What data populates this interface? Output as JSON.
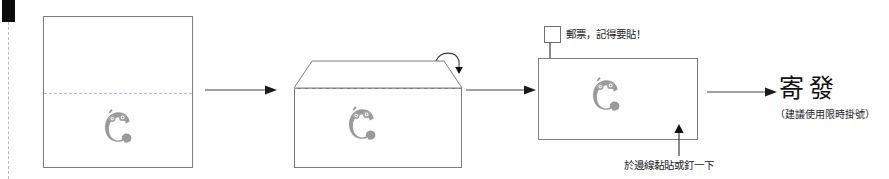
{
  "diagram": {
    "title_text": "寄發",
    "subtitle_text": "（建議使用限時掛號）",
    "stamp_note": "郵票，記得要貼！",
    "edge_note": "於邊線黏貼或釘一下",
    "colors": {
      "outline": "#7d7d7d",
      "fold_line": "#c0bcd8",
      "logo": "#9a9a9a",
      "arrow": "#444444",
      "text": "#1c1c1c",
      "corner_mark": "#0b0b0b",
      "margin_line": "#b9b9b9"
    },
    "steps": [
      {
        "id": "step-1",
        "name": "flat-sheet",
        "has_fold_line": true,
        "has_logo": true
      },
      {
        "id": "step-2",
        "name": "folded-envelope",
        "has_fold_line": true,
        "has_logo": true
      },
      {
        "id": "step-3",
        "name": "sealed-envelope",
        "has_logo": true
      }
    ],
    "connectors": [
      {
        "id": "connector-1",
        "direction": "right"
      },
      {
        "id": "connector-2",
        "direction": "right"
      },
      {
        "id": "connector-3",
        "direction": "right"
      }
    ],
    "annotations": [
      {
        "id": "fold-arrow",
        "name": "fold-over-arrow",
        "direction": "down"
      },
      {
        "id": "stamp-arrow",
        "name": "stamp-placement-arrow",
        "direction": "down"
      },
      {
        "id": "edge-arrow",
        "name": "edge-seal-arrow",
        "direction": "up"
      }
    ]
  }
}
